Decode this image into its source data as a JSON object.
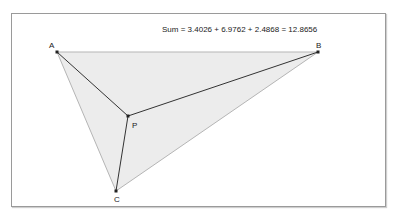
{
  "sum_text": "Sum = 3.4026 + 6.9762 + 2.4868 = 12.8656",
  "points": {
    "A": {
      "label": "A",
      "x": 57,
      "y": 52
    },
    "B": {
      "label": "B",
      "x": 318,
      "y": 52
    },
    "C": {
      "label": "C",
      "x": 116,
      "y": 191
    },
    "P": {
      "label": "P",
      "x": 128,
      "y": 116
    }
  },
  "colors": {
    "triangle_fill": "#ececec",
    "triangle_stroke": "#b5b5b5",
    "segment_stroke": "#333333",
    "point_fill": "#222222"
  }
}
